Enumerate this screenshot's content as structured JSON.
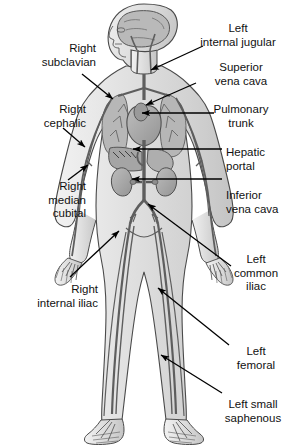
{
  "diagram": {
    "background_color": "#ffffff",
    "line_color": "#000000",
    "body_fill": "#e8e8e8",
    "organ_fill": "#a8a8a8",
    "vessel_fill": "#8f8f8f"
  },
  "labels": {
    "left": [
      {
        "id": "right-subclavian",
        "lines": [
          "Right",
          "subclavian"
        ],
        "x": 14,
        "y": 42,
        "width": 82,
        "align": "right"
      },
      {
        "id": "right-cephalic",
        "lines": [
          "Right",
          "cephalic"
        ],
        "x": 14,
        "y": 103,
        "width": 72,
        "align": "right"
      },
      {
        "id": "right-median-cubital",
        "lines": [
          "Right",
          "median",
          "cubital"
        ],
        "x": 14,
        "y": 180,
        "width": 72,
        "align": "right"
      },
      {
        "id": "right-internal-iliac",
        "lines": [
          "Right",
          "internal iliac"
        ],
        "x": 8,
        "y": 283,
        "width": 90,
        "align": "right"
      }
    ],
    "right": [
      {
        "id": "left-internal-jugular",
        "lines": [
          "Left",
          "internal jugular"
        ],
        "x": 190,
        "y": 22,
        "width": 96,
        "align": "center"
      },
      {
        "id": "superior-vena-cava",
        "lines": [
          "Superior",
          "vena cava"
        ],
        "x": 196,
        "y": 61,
        "width": 90,
        "align": "center"
      },
      {
        "id": "pulmonary-trunk",
        "lines": [
          "Pulmonary",
          "trunk"
        ],
        "x": 196,
        "y": 103,
        "width": 90,
        "align": "center"
      },
      {
        "id": "hepatic-portal",
        "lines": [
          "Hepatic",
          "portal"
        ],
        "x": 226,
        "y": 146,
        "width": 60,
        "align": "left"
      },
      {
        "id": "inferior-vena-cava",
        "lines": [
          "Inferior",
          "vena cava"
        ],
        "x": 226,
        "y": 189,
        "width": 62,
        "align": "left"
      },
      {
        "id": "left-common-iliac",
        "lines": [
          "Left",
          "common",
          "iliac"
        ],
        "x": 226,
        "y": 253,
        "width": 60,
        "align": "center"
      },
      {
        "id": "left-femoral",
        "lines": [
          "Left",
          "femoral"
        ],
        "x": 226,
        "y": 345,
        "width": 60,
        "align": "center"
      },
      {
        "id": "left-small-saphenous",
        "lines": [
          "Left small",
          "saphenous"
        ],
        "x": 219,
        "y": 398,
        "width": 68,
        "align": "center"
      }
    ]
  },
  "leaders": [
    {
      "id": "leader-right-subclavian",
      "x1": 82,
      "y1": 74,
      "x2": 113,
      "y2": 99,
      "arrow": "end"
    },
    {
      "id": "leader-right-cephalic",
      "x1": 63,
      "y1": 128,
      "x2": 85,
      "y2": 147,
      "arrow": "end"
    },
    {
      "id": "leader-right-median-cubital",
      "x1": 68,
      "y1": 180,
      "x2": 88,
      "y2": 165,
      "arrow": "end"
    },
    {
      "id": "leader-right-internal-iliac",
      "x1": 70,
      "y1": 277,
      "x2": 119,
      "y2": 231,
      "arrow": "end"
    },
    {
      "id": "leader-left-internal-jugular",
      "x1": 203,
      "y1": 46,
      "x2": 151,
      "y2": 70,
      "arrow": "end"
    },
    {
      "id": "leader-superior-vena-cava",
      "x1": 196,
      "y1": 83,
      "x2": 146,
      "y2": 105,
      "arrow": "end"
    },
    {
      "id": "leader-pulmonary-trunk",
      "x1": 214,
      "y1": 113,
      "x2": 142,
      "y2": 113,
      "arrow": "end"
    },
    {
      "id": "leader-hepatic-portal",
      "x1": 222,
      "y1": 149,
      "x2": 133,
      "y2": 149,
      "arrow": "end"
    },
    {
      "id": "leader-inferior-vena-cava",
      "x1": 222,
      "y1": 179,
      "x2": 132,
      "y2": 179,
      "arrow": "end"
    },
    {
      "id": "leader-left-common-iliac",
      "x1": 231,
      "y1": 266,
      "x2": 148,
      "y2": 204,
      "arrow": "end"
    },
    {
      "id": "leader-left-femoral",
      "x1": 229,
      "y1": 345,
      "x2": 158,
      "y2": 288,
      "arrow": "end"
    },
    {
      "id": "leader-left-small-saphenous",
      "x1": 222,
      "y1": 393,
      "x2": 161,
      "y2": 355,
      "arrow": "end"
    }
  ]
}
